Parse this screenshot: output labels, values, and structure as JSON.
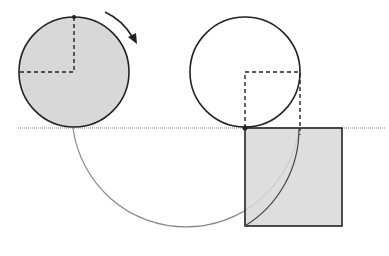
{
  "diagram": {
    "title": "",
    "colors": {
      "stroke": "#222222",
      "fill": "#d8d8d8",
      "baseline": "#777777",
      "arc": "#888888"
    },
    "elements": [
      {
        "id": "left-circle",
        "type": "circle",
        "shaded": true,
        "cx": 74,
        "cy": 72,
        "r": 55
      },
      {
        "id": "right-circle",
        "type": "circle",
        "shaded": false,
        "cx": 245,
        "cy": 72,
        "r": 55
      },
      {
        "id": "rotation-arrow",
        "type": "arrow",
        "direction": "clockwise"
      },
      {
        "id": "baseline",
        "type": "line",
        "y": 128
      },
      {
        "id": "shaded-square",
        "type": "rect",
        "x": 245,
        "y": 128,
        "w": 97,
        "h": 98
      },
      {
        "id": "large-arc",
        "type": "arc",
        "cx": 185,
        "cy": 128,
        "r": 114
      }
    ]
  }
}
